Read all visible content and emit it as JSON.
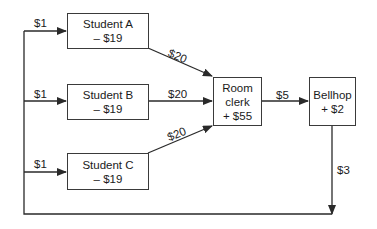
{
  "diagram": {
    "nodes": {
      "student_a": {
        "name": "Student A",
        "value": "– $19"
      },
      "student_b": {
        "name": "Student B",
        "value": "– $19"
      },
      "student_c": {
        "name": "Student C",
        "value": "– $19"
      },
      "room_clerk": {
        "line1": "Room",
        "line2": "clerk",
        "value": "+ $55"
      },
      "bellhop": {
        "name": "Bellhop",
        "value": "+ $2"
      }
    },
    "edges": {
      "to_a": "$1",
      "to_b": "$1",
      "to_c": "$1",
      "a_to_clerk": "$20",
      "b_to_clerk": "$20",
      "c_to_clerk": "$20",
      "clerk_to_bellhop": "$5",
      "bellhop_return": "$3"
    },
    "colors": {
      "line": "#2a2a2a",
      "background": "#ffffff"
    }
  }
}
